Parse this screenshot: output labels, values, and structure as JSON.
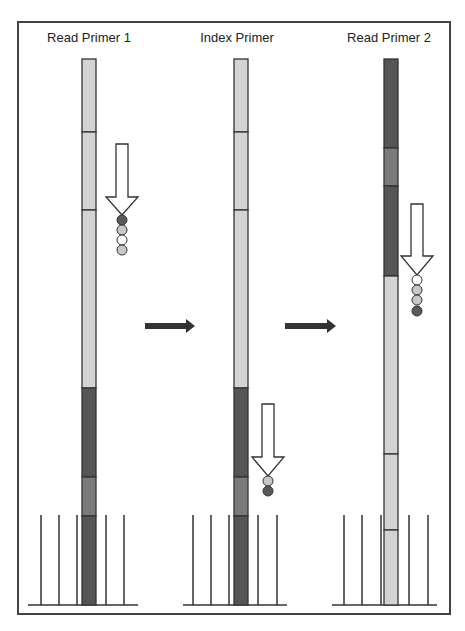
{
  "panels": [
    {
      "title": "Read Primer 1",
      "title_x": 89,
      "strand": {
        "x": 82,
        "width": 14,
        "segments": [
          {
            "y1": 59,
            "y2": 132,
            "shade": "light"
          },
          {
            "y1": 132,
            "y2": 210,
            "shade": "light"
          },
          {
            "y1": 210,
            "y2": 388,
            "shade": "light"
          },
          {
            "y1": 388,
            "y2": 477,
            "shade": "dark"
          },
          {
            "y1": 477,
            "y2": 516,
            "shade": "medium"
          },
          {
            "y1": 516,
            "y2": 605,
            "shade": "dark"
          }
        ]
      },
      "primer_arrow": {
        "cx": 122,
        "top": 144,
        "head_top": 197,
        "head_bottom": 215
      },
      "beads": {
        "cx": 122,
        "cy": [
          220,
          230,
          240,
          250
        ],
        "shades": [
          "dark",
          "light",
          "white",
          "light"
        ]
      },
      "flowcell": {
        "baseline_x1": 28,
        "baseline_x2": 138,
        "lines_x": [
          41,
          59,
          77,
          106,
          124
        ]
      }
    },
    {
      "title": "Index Primer",
      "title_x": 237,
      "strand": {
        "x": 234,
        "width": 14,
        "segments": [
          {
            "y1": 59,
            "y2": 132,
            "shade": "light"
          },
          {
            "y1": 132,
            "y2": 210,
            "shade": "light"
          },
          {
            "y1": 210,
            "y2": 388,
            "shade": "light"
          },
          {
            "y1": 388,
            "y2": 477,
            "shade": "dark"
          },
          {
            "y1": 477,
            "y2": 516,
            "shade": "medium"
          },
          {
            "y1": 516,
            "y2": 605,
            "shade": "dark"
          }
        ]
      },
      "primer_arrow": {
        "cx": 268,
        "top": 404,
        "head_top": 457,
        "head_bottom": 476
      },
      "beads": {
        "cx": 268,
        "cy": [
          481,
          491
        ],
        "shades": [
          "light",
          "dark"
        ]
      },
      "flowcell": {
        "baseline_x1": 183,
        "baseline_x2": 287,
        "lines_x": [
          193,
          211,
          229,
          258,
          277
        ]
      }
    },
    {
      "title": "Read Primer 2",
      "title_x": 389,
      "strand": {
        "x": 384,
        "width": 14,
        "segments": [
          {
            "y1": 59,
            "y2": 148,
            "shade": "dark"
          },
          {
            "y1": 148,
            "y2": 186,
            "shade": "medium"
          },
          {
            "y1": 186,
            "y2": 276,
            "shade": "dark"
          },
          {
            "y1": 276,
            "y2": 454,
            "shade": "light"
          },
          {
            "y1": 454,
            "y2": 530,
            "shade": "light"
          },
          {
            "y1": 530,
            "y2": 605,
            "shade": "light"
          }
        ]
      },
      "primer_arrow": {
        "cx": 417,
        "top": 204,
        "head_top": 256,
        "head_bottom": 275
      },
      "beads": {
        "cx": 417,
        "cy": [
          280,
          290,
          300,
          311
        ],
        "shades": [
          "white",
          "light",
          "light",
          "dark"
        ]
      },
      "flowcell": {
        "baseline_x1": 332,
        "baseline_x2": 437,
        "lines_x": [
          344,
          362,
          381,
          409,
          428
        ]
      }
    }
  ],
  "step_arrows": [
    {
      "x1": 145,
      "x2": 195,
      "y": 326
    },
    {
      "x1": 285,
      "x2": 336,
      "y": 326
    }
  ],
  "colors": {
    "light": "#d3d3d3",
    "medium": "#7a7a7a",
    "dark": "#555555",
    "white": "#ffffff",
    "bead_dark": "#5a5a5a",
    "bead_light": "#c8c8c8",
    "stroke": "#333333",
    "border": "#444444"
  },
  "frame": {
    "x": 18,
    "y": 22,
    "width": 432,
    "height": 592,
    "line_top": 515
  }
}
